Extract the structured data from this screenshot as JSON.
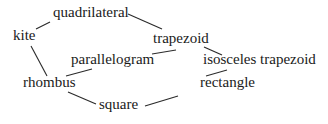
{
  "diagram": {
    "type": "hierarchy",
    "text_color": "#1a1a1a",
    "edge_color": "#2a2a2a",
    "background": "#ffffff",
    "nodes": {
      "quadrilateral": {
        "label": "quadrilateral",
        "x": 53,
        "y": 17
      },
      "kite": {
        "label": "kite",
        "x": 13,
        "y": 40
      },
      "trapezoid": {
        "label": "trapezoid",
        "x": 153,
        "y": 43
      },
      "parallelogram": {
        "label": "parallelogram",
        "x": 71,
        "y": 64
      },
      "isosceles_trapezoid": {
        "label": "isosceles trapezoid",
        "x": 203,
        "y": 64
      },
      "rhombus": {
        "label": "rhombus",
        "x": 23,
        "y": 87
      },
      "rectangle": {
        "label": "rectangle",
        "x": 200,
        "y": 87
      },
      "square": {
        "label": "square",
        "x": 99,
        "y": 109
      }
    },
    "edges": [
      {
        "from": "kite",
        "to": "quadrilateral"
      },
      {
        "from": "quadrilateral",
        "to": "trapezoid"
      },
      {
        "from": "kite",
        "to": "rhombus"
      },
      {
        "from": "trapezoid",
        "to": "parallelogram"
      },
      {
        "from": "trapezoid",
        "to": "isosceles_trapezoid"
      },
      {
        "from": "parallelogram",
        "to": "rhombus"
      },
      {
        "from": "isosceles_trapezoid",
        "to": "rectangle"
      },
      {
        "from": "rhombus",
        "to": "square"
      },
      {
        "from": "square",
        "to": "rectangle"
      }
    ]
  }
}
